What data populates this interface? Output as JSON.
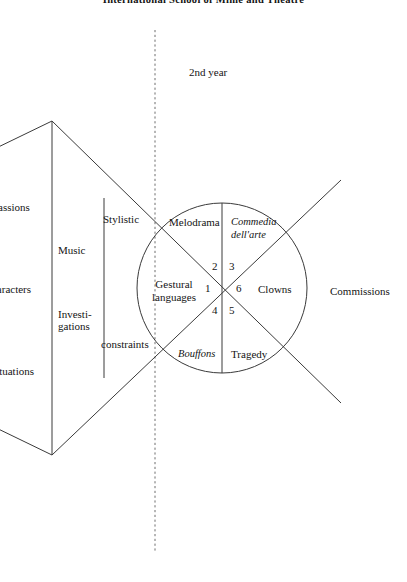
{
  "page": {
    "title": "International School of Mime and Theatre",
    "year_label": "2nd year",
    "width": 407,
    "height": 582,
    "background": "#ffffff",
    "ink": "#141414"
  },
  "left_column": {
    "items": [
      {
        "label": "Passions"
      },
      {
        "label": "Characters"
      },
      {
        "label": "Situations"
      }
    ]
  },
  "middle_band": {
    "items": [
      {
        "label": "Music"
      },
      {
        "label": "Investi-\ngations"
      }
    ]
  },
  "stylistic_band": {
    "top_label": "Stylistic",
    "bottom_label": "constraints"
  },
  "circle": {
    "sectors": [
      {
        "number": "1",
        "label": "Gestural\nlanguages",
        "italic": false
      },
      {
        "number": "2",
        "label": "Melodrama",
        "italic": false
      },
      {
        "number": "3",
        "label": "Commedia\ndell'arte",
        "italic": true
      },
      {
        "number": "4",
        "label": "Bouffons",
        "italic": true
      },
      {
        "number": "5",
        "label": "Tragedy",
        "italic": false
      },
      {
        "number": "6",
        "label": "Clowns",
        "italic": false
      }
    ],
    "numbers": {
      "n1": "1",
      "n2": "2",
      "n3": "3",
      "n4": "4",
      "n5": "5",
      "n6": "6"
    }
  },
  "right_column": {
    "label": "Commissions"
  },
  "geometry": {
    "circle_center_x": 222,
    "circle_center_y": 288,
    "circle_radius": 85,
    "dashed_line_x": 155,
    "dashed_line_top": 30,
    "dashed_line_bottom": 551
  }
}
